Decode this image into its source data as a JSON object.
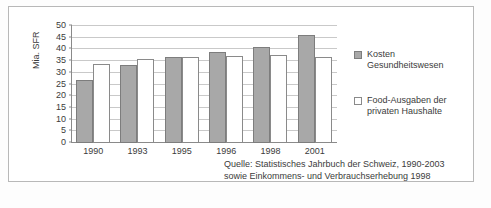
{
  "chart_data": {
    "type": "bar",
    "title": "",
    "xlabel": "",
    "ylabel": "Mia. SFR",
    "ylim": [
      0,
      50
    ],
    "ytick_step": 5,
    "yticks": [
      50,
      45,
      40,
      35,
      30,
      25,
      20,
      15,
      10,
      5,
      0
    ],
    "grid": true,
    "legend_position": "right",
    "categories": [
      "1990",
      "1993",
      "1995",
      "1996",
      "1998",
      "2001"
    ],
    "series": [
      {
        "name": "Kosten Gesundheitswesen",
        "color": "#a8a8a8",
        "values": [
          26.5,
          33.0,
          36.3,
          38.4,
          40.5,
          45.8
        ]
      },
      {
        "name": "Food-Ausgaben der privaten Haushalte",
        "color": "#ffffff",
        "values": [
          33.3,
          35.5,
          36.5,
          36.8,
          37.2,
          36.5
        ]
      }
    ]
  },
  "axes": {
    "y_title": "Mia. SFR",
    "y_ticks": [
      "50",
      "45",
      "40",
      "35",
      "30",
      "25",
      "20",
      "15",
      "10",
      "5",
      "0"
    ],
    "x_ticks": [
      "1990",
      "1993",
      "1995",
      "1996",
      "1998",
      "2001"
    ]
  },
  "legend": {
    "items": [
      {
        "swatch": "cost",
        "label": "Kosten\nGesundheitswesen",
        "line1": "Kosten",
        "line2": "Gesundheitswesen"
      },
      {
        "swatch": "food",
        "label": "Food-Ausgaben der privaten Haushalte",
        "line1": "Food-Ausgaben der",
        "line2": "privaten Haushalte"
      }
    ]
  },
  "source": {
    "line1": "Quelle: Statistisches Jahrbuch der Schweiz, 1990-2003",
    "line2": "sowie Einkommens- und Verbrauchserhebung 1998"
  },
  "caption_strip": {
    "text": ""
  },
  "colors": {
    "cost_fill": "#a8a8a8",
    "cost_border": "#7d7d7d",
    "food_fill": "#ffffff",
    "food_border": "#8a8a8a",
    "gridline": "#c9c9c9",
    "axis": "#8a8a8a",
    "text": "#3b3b3b",
    "frame": "#b8b8b8"
  }
}
